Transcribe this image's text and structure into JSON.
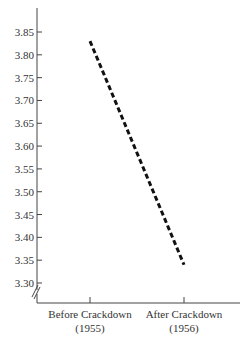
{
  "chart_data": {
    "type": "line",
    "title": "",
    "xlabel": "",
    "ylabel": "",
    "categories": [
      "Before Crackdown (1955)",
      "After Crackdown (1956)"
    ],
    "category_lines": [
      [
        "Before Crackdown",
        "(1955)"
      ],
      [
        "After Crackdown",
        "(1956)"
      ]
    ],
    "series": [
      {
        "name": "rate",
        "values": [
          3.83,
          3.34
        ],
        "style": "dashed",
        "color": "#111111"
      }
    ],
    "ylim": [
      3.3,
      3.85
    ],
    "yticks": [
      "3.85",
      "3.80",
      "3.75",
      "3.70",
      "3.65",
      "3.60",
      "3.55",
      "3.50",
      "3.45",
      "3.40",
      "3.35",
      "3.30"
    ],
    "axis_break": true,
    "grid": false,
    "legend": null
  }
}
